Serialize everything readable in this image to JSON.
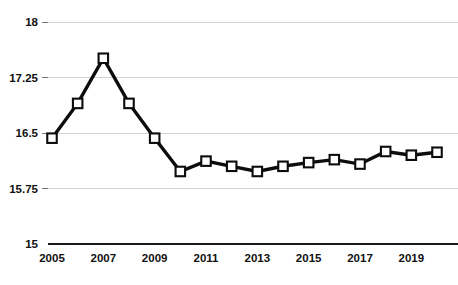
{
  "chart_data": {
    "type": "line",
    "title": "",
    "xlabel": "",
    "ylabel": "",
    "x": [
      2005,
      2006,
      2007,
      2008,
      2009,
      2010,
      2011,
      2012,
      2013,
      2014,
      2015,
      2016,
      2017,
      2018,
      2019,
      2020
    ],
    "values": [
      16.43,
      16.9,
      17.51,
      16.9,
      16.43,
      15.98,
      16.12,
      16.05,
      15.98,
      16.05,
      16.1,
      16.14,
      16.08,
      16.25,
      16.2,
      16.24
    ],
    "series": [
      {
        "name": "series-1",
        "values": [
          16.43,
          16.9,
          17.51,
          16.9,
          16.43,
          15.98,
          16.12,
          16.05,
          15.98,
          16.05,
          16.1,
          16.14,
          16.08,
          16.25,
          16.2,
          16.24
        ]
      }
    ],
    "ylim": [
      15,
      18
    ],
    "xlim": [
      2005,
      2020
    ],
    "yticks": [
      15,
      15.75,
      16.5,
      17.25,
      18
    ],
    "ytick_labels": [
      "15",
      "15.75",
      "16.5",
      "17.25",
      "18"
    ],
    "xticks": [
      2005,
      2007,
      2009,
      2011,
      2013,
      2015,
      2017,
      2019
    ],
    "xtick_labels": [
      "2005",
      "2007",
      "2009",
      "2011",
      "2013",
      "2015",
      "2017",
      "2019"
    ],
    "grid": true,
    "legend": false,
    "legend_position": "none",
    "marker": "square",
    "line_color": "#0d0d0d",
    "marker_fill": "#ffffff",
    "grid_color": "#d2d2d2",
    "axis_color": "#1a1a1a"
  },
  "clipped_header": {
    "text": "· ·"
  }
}
